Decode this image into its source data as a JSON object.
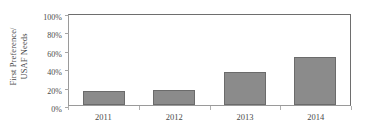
{
  "chart_data": {
    "type": "bar",
    "title": "",
    "subtitle": "",
    "xlabel": "",
    "ylabel": "First Preference/ USAF Needs",
    "ylabel_lines": [
      "First Preference/",
      "USAF Needs"
    ],
    "categories": [
      "2011",
      "2012",
      "2013",
      "2014"
    ],
    "values": [
      15,
      16,
      36,
      52
    ],
    "value_labels": [
      "15%",
      "16%",
      "36%",
      "52%"
    ],
    "series": [
      {
        "name": "First Preference/ USAF Needs",
        "values": [
          15,
          16,
          36,
          52
        ]
      }
    ],
    "ylim": [
      0,
      100
    ],
    "y_ticks": [
      0,
      20,
      40,
      60,
      80,
      100
    ],
    "y_tick_labels": [
      "0%",
      "20%",
      "40%",
      "60%",
      "80%",
      "100%"
    ],
    "grid": false,
    "legend": false,
    "legend_position": "none",
    "bar_color": "#8b8b8b",
    "bar_border_color": "#6b6b6b",
    "axis_color": "#6e6e6e",
    "text_color": "#4a4a4a",
    "background_color": "#ffffff"
  }
}
